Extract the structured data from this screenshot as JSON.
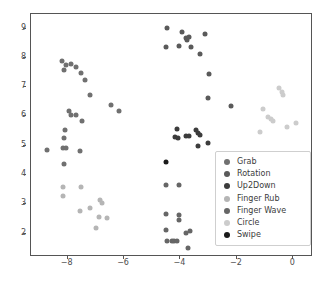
{
  "figure": {
    "background": "#ffffff",
    "axes_color": "#555555",
    "tick_color": "#4d4d4d"
  },
  "legend": {
    "position": "center-right",
    "entries": [
      {
        "label": "Grab",
        "color": "#707070"
      },
      {
        "label": "Rotation",
        "color": "#5a5a5a"
      },
      {
        "label": "Up2Down",
        "color": "#3c3c3c"
      },
      {
        "label": "Finger Rub",
        "color": "#b5b5b5"
      },
      {
        "label": "Finger Wave",
        "color": "#666666"
      },
      {
        "label": "Circle",
        "color": "#cccccc"
      },
      {
        "label": "Swipe",
        "color": "#1a1a1a"
      }
    ]
  },
  "chart_data": {
    "type": "scatter",
    "title": "",
    "xlabel": "",
    "ylabel": "",
    "xlim": [
      -9.3,
      0.7
    ],
    "ylim": [
      1.2,
      9.5
    ],
    "xticks": [
      -8,
      -6,
      -4,
      -2,
      0
    ],
    "yticks": [
      2,
      3,
      4,
      5,
      6,
      7,
      8,
      9
    ],
    "xticklabels": [
      "−8",
      "−6",
      "−4",
      "−2",
      "0"
    ],
    "yticklabels": [
      "2",
      "3",
      "4",
      "5",
      "6",
      "7",
      "8",
      "9"
    ],
    "grid": false,
    "marker": "o",
    "marker_size": 5,
    "series": [
      {
        "name": "Grab",
        "color": "#707070",
        "points": [
          [
            -8.2,
            7.88
          ],
          [
            -8.05,
            7.75
          ],
          [
            -8.12,
            7.58
          ],
          [
            -7.88,
            7.78
          ],
          [
            -7.7,
            7.7
          ],
          [
            -7.52,
            7.48
          ],
          [
            -7.4,
            7.25
          ],
          [
            -7.22,
            6.74
          ],
          [
            -6.45,
            6.38
          ],
          [
            -6.18,
            6.2
          ],
          [
            -7.95,
            6.18
          ],
          [
            -7.88,
            6.05
          ],
          [
            -7.72,
            6.05
          ],
          [
            -7.5,
            5.84
          ],
          [
            -8.1,
            5.54
          ],
          [
            -8.12,
            5.25
          ],
          [
            -8.15,
            4.92
          ],
          [
            -8.05,
            4.92
          ],
          [
            -7.58,
            4.83
          ],
          [
            -8.72,
            4.86
          ],
          [
            -8.12,
            4.37
          ]
        ]
      },
      {
        "name": "Rotation",
        "color": "#5a5a5a",
        "points": [
          [
            -4.48,
            9.03
          ],
          [
            -4.52,
            8.38
          ],
          [
            -3.95,
            8.9
          ],
          [
            -3.82,
            8.68
          ],
          [
            -3.78,
            8.62
          ],
          [
            -3.68,
            8.7
          ],
          [
            -3.62,
            8.38
          ],
          [
            -4.05,
            8.42
          ],
          [
            -3.12,
            8.82
          ],
          [
            -3.3,
            8.12
          ],
          [
            -2.98,
            7.46
          ],
          [
            -3.02,
            6.62
          ],
          [
            -2.22,
            6.36
          ]
        ]
      },
      {
        "name": "Up2Down",
        "color": "#3c3c3c",
        "points": [
          [
            -4.12,
            5.56
          ],
          [
            -4.18,
            5.3
          ],
          [
            -4.1,
            5.28
          ],
          [
            -3.82,
            5.32
          ],
          [
            -3.7,
            5.32
          ],
          [
            -3.45,
            5.55
          ],
          [
            -3.38,
            5.42
          ],
          [
            -3.3,
            5.36
          ],
          [
            -3.38,
            5.0
          ],
          [
            -3.02,
            5.1
          ]
        ]
      },
      {
        "name": "Finger Rub",
        "color": "#b5b5b5",
        "points": [
          [
            -8.18,
            3.6
          ],
          [
            -8.15,
            3.3
          ],
          [
            -7.52,
            3.58
          ],
          [
            -7.58,
            2.78
          ],
          [
            -7.22,
            2.88
          ],
          [
            -6.85,
            3.14
          ],
          [
            -6.8,
            3.04
          ],
          [
            -6.9,
            2.55
          ],
          [
            -6.98,
            2.19
          ],
          [
            -6.62,
            2.54
          ]
        ]
      },
      {
        "name": "Finger Wave",
        "color": "#666666",
        "points": [
          [
            -4.52,
            3.66
          ],
          [
            -4.52,
            2.68
          ],
          [
            -4.5,
            2.11
          ],
          [
            -4.05,
            2.62
          ],
          [
            -4.05,
            2.45
          ],
          [
            -4.48,
            1.74
          ],
          [
            -4.3,
            1.76
          ],
          [
            -4.22,
            1.76
          ],
          [
            -4.12,
            1.76
          ],
          [
            -3.8,
            2.02
          ],
          [
            -3.65,
            2.08
          ],
          [
            -3.72,
            1.5
          ],
          [
            -4.05,
            3.66
          ]
        ]
      },
      {
        "name": "Circle",
        "color": "#cccccc",
        "points": [
          [
            -0.52,
            6.97
          ],
          [
            -0.4,
            6.82
          ],
          [
            -0.38,
            6.74
          ],
          [
            -1.08,
            6.24
          ],
          [
            -0.88,
            5.98
          ],
          [
            -0.8,
            5.92
          ],
          [
            -0.72,
            5.86
          ],
          [
            -1.18,
            5.48
          ],
          [
            -0.22,
            5.65
          ],
          [
            0.08,
            5.78
          ]
        ]
      },
      {
        "name": "Swipe",
        "color": "#1a1a1a",
        "points": [
          [
            -4.5,
            4.43
          ]
        ]
      }
    ]
  }
}
